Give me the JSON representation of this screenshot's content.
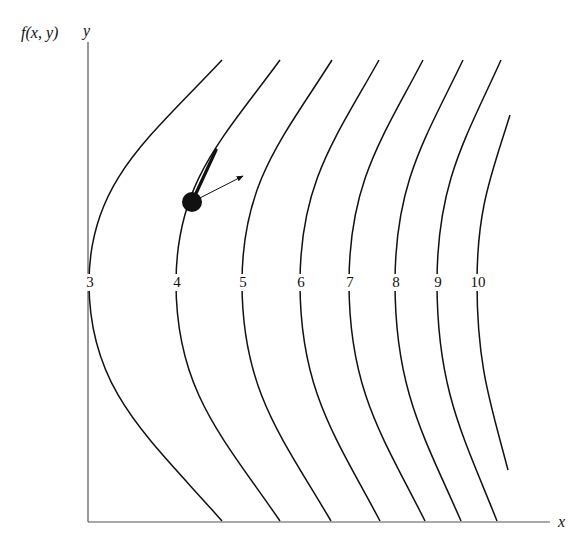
{
  "figure": {
    "function_label": "f(x, y)",
    "y_axis_label": "y",
    "x_axis_label": "x"
  },
  "chart_data": {
    "type": "contour",
    "title": "",
    "xlabel": "x",
    "ylabel": "y",
    "function_label": "f(x, y)",
    "level_labels": [
      "3",
      "4",
      "5",
      "6",
      "7",
      "8",
      "9",
      "10"
    ],
    "levels": [
      3,
      4,
      5,
      6,
      7,
      8,
      9,
      10
    ],
    "grid": false,
    "annotations": [
      {
        "type": "point",
        "description": "marked point on level curve 4"
      },
      {
        "type": "tangent-line",
        "description": "thick tangent segment along curve 4 at the point"
      },
      {
        "type": "arrow",
        "description": "gradient vector perpendicular to level curve, pointing toward higher levels"
      }
    ]
  },
  "curves": [
    {
      "label": "3",
      "top": [
        222,
        60
      ],
      "vertex": [
        89,
        283
      ],
      "bottom": [
        222,
        521
      ],
      "label_x": 90
    },
    {
      "label": "4",
      "top": [
        280,
        60
      ],
      "vertex": [
        176,
        283
      ],
      "bottom": [
        280,
        521
      ],
      "label_x": 177
    },
    {
      "label": "5",
      "top": [
        332,
        60
      ],
      "vertex": [
        242,
        283
      ],
      "bottom": [
        331,
        521
      ],
      "label_x": 243
    },
    {
      "label": "6",
      "top": [
        379,
        60
      ],
      "vertex": [
        300,
        283
      ],
      "bottom": [
        380,
        521
      ],
      "label_x": 301
    },
    {
      "label": "7",
      "top": [
        423,
        60
      ],
      "vertex": [
        349,
        283
      ],
      "bottom": [
        425,
        521
      ],
      "label_x": 350
    },
    {
      "label": "8",
      "top": [
        463,
        60
      ],
      "vertex": [
        395,
        283
      ],
      "bottom": [
        461,
        521
      ],
      "label_x": 396
    },
    {
      "label": "9",
      "top": [
        501,
        60
      ],
      "vertex": [
        437,
        283
      ],
      "bottom": [
        497,
        521
      ],
      "label_x": 438
    },
    {
      "label": "10",
      "top": [
        510,
        115
      ],
      "vertex": [
        477,
        283
      ],
      "bottom": [
        508,
        470
      ],
      "label_x": 478
    }
  ]
}
